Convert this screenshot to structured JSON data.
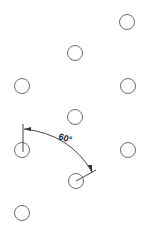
{
  "diagram": {
    "type": "bolt-hole-pattern-drawing",
    "holes": [
      {
        "cx": 127,
        "cy": 22,
        "r": 7.5
      },
      {
        "cx": 75,
        "cy": 53,
        "r": 7.5
      },
      {
        "cx": 22,
        "cy": 86,
        "r": 7.5
      },
      {
        "cx": 128,
        "cy": 86,
        "r": 7.5
      },
      {
        "cx": 75,
        "cy": 117,
        "r": 7.5
      },
      {
        "cx": 22,
        "cy": 150,
        "r": 7.5
      },
      {
        "cx": 128,
        "cy": 150,
        "r": 7.5
      },
      {
        "cx": 76,
        "cy": 181,
        "r": 7.5
      },
      {
        "cx": 22,
        "cy": 213,
        "r": 7.5
      }
    ],
    "angle_dimension": {
      "label": "60°",
      "from_hole_index": 5,
      "to_hole_index": 7
    }
  }
}
